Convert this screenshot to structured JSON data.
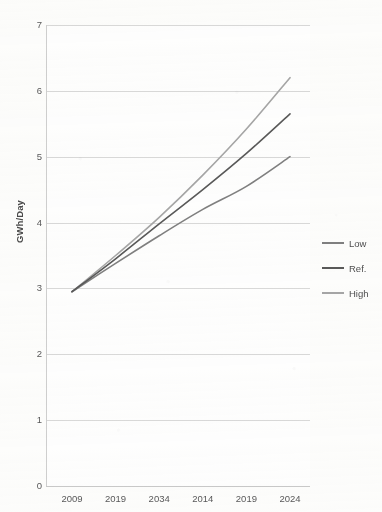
{
  "chart_data": {
    "type": "line",
    "title": "",
    "subtitle": "",
    "xlabel": "",
    "ylabel": "GWh/Day",
    "xlim": [
      0,
      5
    ],
    "ylim": [
      0,
      7
    ],
    "yticks": [
      "0",
      "1",
      "2",
      "3",
      "4",
      "5",
      "6",
      "7"
    ],
    "ytick_values": [
      0,
      1,
      2,
      3,
      4,
      5,
      6,
      7
    ],
    "grid": "horizontal",
    "legend_position": "right",
    "categories": [
      "2009",
      "2019",
      "2034",
      "2014",
      "2019",
      "2024"
    ],
    "x": [
      0,
      1,
      2,
      3,
      4,
      5
    ],
    "series": [
      {
        "name": "Low",
        "color": "#808080",
        "values": [
          2.95,
          3.38,
          3.8,
          4.2,
          4.55,
          5.0
        ]
      },
      {
        "name": "Ref.",
        "color": "#595959",
        "values": [
          2.95,
          3.45,
          3.98,
          4.5,
          5.05,
          5.65
        ]
      },
      {
        "name": "High",
        "color": "#a6a6a6",
        "values": [
          2.95,
          3.5,
          4.08,
          4.72,
          5.42,
          6.2
        ]
      }
    ]
  },
  "axes": {
    "y_title": "GWh/Day",
    "y_tick_labels": [
      "7",
      "6",
      "5",
      "4",
      "3",
      "2",
      "1",
      "0"
    ],
    "x_tick_labels": [
      "2009",
      "2019",
      "2034",
      "2014",
      "2019",
      "2024"
    ]
  },
  "legend": {
    "entries": [
      {
        "label": "Low",
        "color": "#808080"
      },
      {
        "label": "Ref.",
        "color": "#595959"
      },
      {
        "label": "High",
        "color": "#a6a6a6"
      }
    ]
  },
  "colors": {
    "background": "#fdfdfc",
    "gridline": "#d9d9d9",
    "axis_line": "#d0d0d0",
    "tick_text": "#59595a",
    "title_text": "#4a4a4a",
    "series_low": "#808080",
    "series_ref": "#595959",
    "series_high": "#a6a6a6"
  },
  "plot_geometry": {
    "left": 46,
    "right": 310,
    "top": 25,
    "bottom": 486
  }
}
